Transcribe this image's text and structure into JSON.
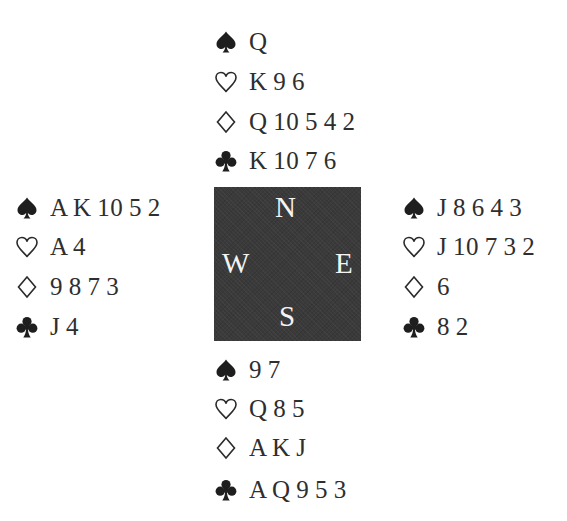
{
  "compass": {
    "north": "N",
    "west": "W",
    "east": "E",
    "south": "S",
    "background": "#3a3a3a",
    "text_color": "#f4f4f4"
  },
  "suits": {
    "spades": {
      "name": "spade-icon",
      "filled": true
    },
    "hearts": {
      "name": "heart-icon",
      "filled": false
    },
    "diamonds": {
      "name": "diamond-icon",
      "filled": false
    },
    "clubs": {
      "name": "club-icon",
      "filled": true
    }
  },
  "hands": {
    "north": {
      "spades": "Q",
      "hearts": "K 9 6",
      "diamonds": "Q 10 5 4 2",
      "clubs": "K 10 7 6"
    },
    "west": {
      "spades": "A K 10 5 2",
      "hearts": "A 4",
      "diamonds": "9 8 7 3",
      "clubs": "J 4"
    },
    "east": {
      "spades": "J 8 6 4 3",
      "hearts": "J 10 7 3 2",
      "diamonds": "6",
      "clubs": "8 2"
    },
    "south": {
      "spades": "9 7",
      "hearts": "Q 8 5",
      "diamonds": "A K J",
      "clubs": "A Q 9 5 3"
    }
  }
}
